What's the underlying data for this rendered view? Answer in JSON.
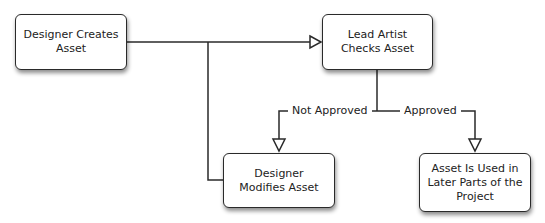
{
  "diagram": {
    "type": "flowchart",
    "nodes": [
      {
        "id": "n1",
        "label": "Designer Creates Asset"
      },
      {
        "id": "n2",
        "label": "Lead Artist Checks Asset"
      },
      {
        "id": "n3",
        "label": "Designer Modifies Asset"
      },
      {
        "id": "n4",
        "label": "Asset Is Used in Later Parts of the Project"
      }
    ],
    "edges": [
      {
        "from": "n1",
        "to": "n2",
        "label": ""
      },
      {
        "from": "n3",
        "to": "n2",
        "label": ""
      },
      {
        "from": "n2",
        "to": "n3",
        "label": "Not Approved"
      },
      {
        "from": "n2",
        "to": "n4",
        "label": "Approved"
      }
    ],
    "labels": {
      "not_approved": "Not Approved",
      "approved": "Approved"
    },
    "colors": {
      "line": "#2a2a2a",
      "node_fill": "#ffffff",
      "text": "#222222"
    }
  }
}
